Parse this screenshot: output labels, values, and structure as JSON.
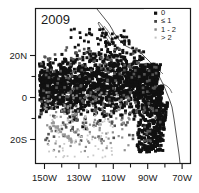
{
  "chart_data": {
    "type": "scatter",
    "title": "2009",
    "subtitle": "",
    "xlabel": "",
    "ylabel": "",
    "projection": "equirectangular-map",
    "grid": false,
    "xlim": [
      -155,
      -65
    ],
    "ylim": [
      -28,
      28
    ],
    "xticks": [
      -150,
      -130,
      -110,
      -90,
      -70
    ],
    "xticklabels": [
      "150W",
      "130W",
      "110W",
      "90W",
      "70W"
    ],
    "xminorticks": [
      -140,
      -120,
      -100,
      -80
    ],
    "yticks": [
      20,
      0,
      -20
    ],
    "yticklabels": [
      "20N",
      "0",
      "20S"
    ],
    "yminorticks": [
      10,
      -10
    ],
    "legend": {
      "position": "top-right",
      "entries": [
        {
          "label": "0",
          "color": "#111111",
          "size": 3.2
        },
        {
          "label": "≤ 1",
          "color": "#444444",
          "size": 2.8
        },
        {
          "label": "1 - 2",
          "color": "#888888",
          "size": 2.4
        },
        {
          "label": "> 2",
          "color": "#c2c2c2",
          "size": 2.0
        }
      ]
    },
    "series": [
      {
        "name": "0",
        "color": "#111111",
        "marker": "square",
        "size": 3.0,
        "description": "Dense black squares forming a broad equatorial band from 150W to the South American coast, extending roughly 12N to 22S, with highest density between 8N and 12S.",
        "count_estimate": 1850
      },
      {
        "name": "≤ 1",
        "color": "#555555",
        "marker": "square",
        "size": 2.6,
        "description": "Mid-gray squares interspersed at the margins of the main band and scattered north toward 20N.",
        "count_estimate": 260
      },
      {
        "name": "1 - 2",
        "color": "#8f8f8f",
        "marker": "square",
        "size": 2.2,
        "description": "Light gray squares sparsely placed in the southwest quadrant and along band edges.",
        "count_estimate": 120
      },
      {
        "name": "> 2",
        "color": "#c9c9c9",
        "marker": "square",
        "size": 1.8,
        "description": "Very light gray points sparse in the far southwest near 140W-120W, 15S-25S.",
        "count_estimate": 80
      }
    ],
    "annotations": [
      "Coastline of Central and South America drawn as thin black outline from upper-center to lower-right.",
      "Baja California peninsula visible near 112W, 25N."
    ]
  }
}
